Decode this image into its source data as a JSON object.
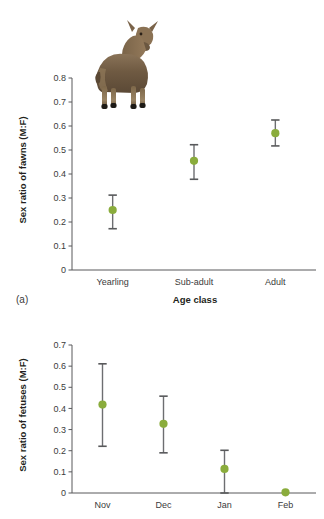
{
  "figure": {
    "background": "#ffffff",
    "marker_color": "#8aac3c",
    "axis_color": "#58595b",
    "errorbar_color": "#6d6e71"
  },
  "panel_a": {
    "letter": "(a)",
    "image_caption": "mule-deer-photo",
    "chart_data": {
      "type": "scatter",
      "title": "",
      "xlabel": "Age class",
      "ylabel": "Sex ratio of fawns (M:F)",
      "categories": [
        "Yearling",
        "Sub-adult",
        "Adult"
      ],
      "values": [
        0.25,
        0.455,
        0.57
      ],
      "error_low": [
        0.172,
        0.378,
        0.517
      ],
      "error_high": [
        0.312,
        0.522,
        0.625
      ],
      "ylim": [
        0,
        0.8
      ],
      "yticks": [
        0,
        0.1,
        0.2,
        0.3,
        0.4,
        0.5,
        0.6,
        0.7,
        0.8
      ],
      "ytick_labels": [
        "0",
        "0.1",
        "0.2",
        "0.3",
        "0.4",
        "0.5",
        "0.6",
        "0.7",
        "0.8"
      ],
      "grid": false,
      "legend": "none"
    }
  },
  "panel_b": {
    "letter": "",
    "chart_data": {
      "type": "scatter",
      "title": "",
      "xlabel": "",
      "ylabel": "Sex ratio of fetuses (M:F)",
      "categories": [
        "Nov",
        "Dec",
        "Jan",
        "Feb"
      ],
      "values": [
        0.418,
        0.327,
        0.114,
        0.003
      ],
      "error_low": [
        0.221,
        0.19,
        0.0,
        0.003
      ],
      "error_high": [
        0.611,
        0.458,
        0.202,
        0.003
      ],
      "ylim": [
        0,
        0.7
      ],
      "yticks": [
        0,
        0.1,
        0.2,
        0.3,
        0.4,
        0.5,
        0.6,
        0.7
      ],
      "ytick_labels": [
        "0",
        "0.1",
        "0.2",
        "0.3",
        "0.4",
        "0.5",
        "0.6",
        "0.7"
      ],
      "grid": false,
      "legend": "none"
    }
  }
}
